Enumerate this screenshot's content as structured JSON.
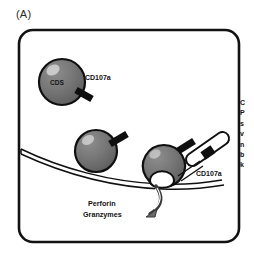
{
  "figure": {
    "panel_label": "(A)",
    "cells": [
      {
        "name": "cd8-tcell-free",
        "inner_label": "CDS",
        "marker_label": "CD107a"
      },
      {
        "name": "cd8-tcell-contact",
        "inner_label": "",
        "marker_label": ""
      },
      {
        "name": "cd8-tcell-degranulating",
        "inner_label": "",
        "marker_label": "CD107a"
      }
    ],
    "marker_label_left": "CD107a",
    "marker_label_right": "CD107a",
    "secretion": {
      "line1": "Perforin",
      "line2": "Granzymes"
    },
    "side_caption_lines": [
      "C",
      "P",
      "s",
      "v",
      "n",
      "b",
      "k"
    ],
    "colors": {
      "cell_fill": "#6f6f6f",
      "cell_fill_light": "#8a8a8a",
      "outline": "#111111",
      "background": "#ffffff",
      "marker": "#111111"
    }
  }
}
